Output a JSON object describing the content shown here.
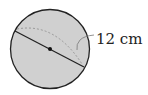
{
  "figure": {
    "shape": "sphere",
    "measurement_label": "12 cm",
    "measured_quantity": "diameter",
    "colors": {
      "fill": "#d0d0d0",
      "outline": "#222222",
      "equator_dashed": "#999999"
    }
  }
}
